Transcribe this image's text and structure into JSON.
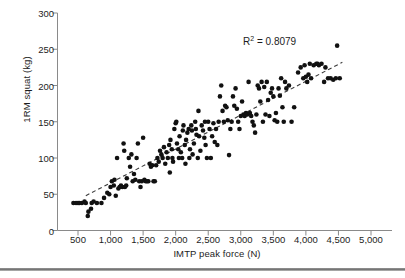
{
  "figure": {
    "name": "scatter-plot-imtp-vs-1rm-squat",
    "annotation": {
      "label_prefix": "R",
      "label_sup": "2",
      "label_suffix": " = 0.8079",
      "full": "R² = 0.8079"
    }
  },
  "chart_data": {
    "type": "scatter",
    "title": "",
    "xlabel": "IMTP peak force (N)",
    "ylabel": "1RM squat (kg)",
    "xlim": [
      0,
      5250
    ],
    "ylim": [
      0,
      300
    ],
    "xticks": [
      500,
      1000,
      1500,
      2000,
      2500,
      3000,
      3500,
      4000,
      4500,
      5000
    ],
    "xtick_labels": [
      "500",
      "1,000",
      "1,500",
      "2,000",
      "2,500",
      "3,000",
      "3,500",
      "4,000",
      "4,500",
      "5,000"
    ],
    "yticks": [
      0,
      50,
      100,
      150,
      200,
      250,
      300
    ],
    "ytick_labels": [
      "0",
      "50",
      "100",
      "150",
      "200",
      "250",
      "300"
    ],
    "grid": false,
    "legend": null,
    "marker": {
      "shape": "circle",
      "color": "#111111",
      "size_px": 4.6
    },
    "annotations": [
      {
        "text": "R² = 0.8079",
        "x": 3650,
        "y": 268
      }
    ],
    "trendline": {
      "style": "dashed",
      "color": "#3a3a3a",
      "x_start": 620,
      "y_start": 48,
      "x_end": 4560,
      "y_end": 232
    },
    "r_squared": 0.8079,
    "n_points": 190,
    "points": [
      [
        430,
        38
      ],
      [
        470,
        38
      ],
      [
        500,
        38
      ],
      [
        520,
        38
      ],
      [
        560,
        38
      ],
      [
        600,
        40
      ],
      [
        620,
        38
      ],
      [
        650,
        20
      ],
      [
        660,
        26
      ],
      [
        700,
        30
      ],
      [
        710,
        38
      ],
      [
        740,
        40
      ],
      [
        790,
        38
      ],
      [
        860,
        38
      ],
      [
        900,
        45
      ],
      [
        950,
        52
      ],
      [
        980,
        50
      ],
      [
        1000,
        60
      ],
      [
        1020,
        68
      ],
      [
        1050,
        62
      ],
      [
        1060,
        70
      ],
      [
        1080,
        48
      ],
      [
        1100,
        100
      ],
      [
        1120,
        58
      ],
      [
        1140,
        60
      ],
      [
        1160,
        62
      ],
      [
        1180,
        60
      ],
      [
        1200,
        120
      ],
      [
        1210,
        110
      ],
      [
        1220,
        60
      ],
      [
        1240,
        62
      ],
      [
        1250,
        72
      ],
      [
        1280,
        100
      ],
      [
        1300,
        88
      ],
      [
        1320,
        105
      ],
      [
        1340,
        68
      ],
      [
        1360,
        78
      ],
      [
        1380,
        70
      ],
      [
        1400,
        100
      ],
      [
        1420,
        120
      ],
      [
        1440,
        68
      ],
      [
        1460,
        60
      ],
      [
        1480,
        68
      ],
      [
        1500,
        128
      ],
      [
        1520,
        70
      ],
      [
        1540,
        68
      ],
      [
        1560,
        68
      ],
      [
        1580,
        68
      ],
      [
        1600,
        92
      ],
      [
        1620,
        88
      ],
      [
        1640,
        90
      ],
      [
        1660,
        68
      ],
      [
        1680,
        68
      ],
      [
        1700,
        90
      ],
      [
        1720,
        100
      ],
      [
        1740,
        95
      ],
      [
        1760,
        110
      ],
      [
        1780,
        105
      ],
      [
        1800,
        100
      ],
      [
        1820,
        115
      ],
      [
        1840,
        92
      ],
      [
        1860,
        108
      ],
      [
        1880,
        100
      ],
      [
        1900,
        118
      ],
      [
        1910,
        80
      ],
      [
        1920,
        125
      ],
      [
        1940,
        112
      ],
      [
        1950,
        100
      ],
      [
        1960,
        95
      ],
      [
        1980,
        140
      ],
      [
        2000,
        148
      ],
      [
        2010,
        150
      ],
      [
        2020,
        120
      ],
      [
        2040,
        112
      ],
      [
        2050,
        100
      ],
      [
        2060,
        130
      ],
      [
        2080,
        108
      ],
      [
        2100,
        100
      ],
      [
        2110,
        138
      ],
      [
        2120,
        145
      ],
      [
        2140,
        118
      ],
      [
        2150,
        92
      ],
      [
        2160,
        125
      ],
      [
        2180,
        135
      ],
      [
        2200,
        140
      ],
      [
        2210,
        100
      ],
      [
        2220,
        112
      ],
      [
        2240,
        145
      ],
      [
        2250,
        138
      ],
      [
        2260,
        105
      ],
      [
        2280,
        120
      ],
      [
        2300,
        150
      ],
      [
        2310,
        140
      ],
      [
        2320,
        132
      ],
      [
        2340,
        100
      ],
      [
        2350,
        165
      ],
      [
        2360,
        130
      ],
      [
        2380,
        110
      ],
      [
        2400,
        145
      ],
      [
        2420,
        138
      ],
      [
        2440,
        128
      ],
      [
        2450,
        150
      ],
      [
        2460,
        118
      ],
      [
        2480,
        100
      ],
      [
        2500,
        150
      ],
      [
        2520,
        140
      ],
      [
        2540,
        100
      ],
      [
        2560,
        130
      ],
      [
        2580,
        148
      ],
      [
        2600,
        122
      ],
      [
        2620,
        140
      ],
      [
        2640,
        118
      ],
      [
        2660,
        150
      ],
      [
        2680,
        185
      ],
      [
        2700,
        200
      ],
      [
        2720,
        165
      ],
      [
        2740,
        150
      ],
      [
        2760,
        172
      ],
      [
        2780,
        170
      ],
      [
        2800,
        152
      ],
      [
        2820,
        104
      ],
      [
        2840,
        140
      ],
      [
        2860,
        150
      ],
      [
        2880,
        185
      ],
      [
        2900,
        172
      ],
      [
        2920,
        196
      ],
      [
        2940,
        168
      ],
      [
        2960,
        150
      ],
      [
        2980,
        140
      ],
      [
        3000,
        158
      ],
      [
        3020,
        178
      ],
      [
        3040,
        160
      ],
      [
        3060,
        158
      ],
      [
        3080,
        162
      ],
      [
        3100,
        160
      ],
      [
        3120,
        205
      ],
      [
        3140,
        162
      ],
      [
        3160,
        158
      ],
      [
        3180,
        150
      ],
      [
        3200,
        145
      ],
      [
        3220,
        135
      ],
      [
        3240,
        160
      ],
      [
        3260,
        200
      ],
      [
        3280,
        196
      ],
      [
        3300,
        178
      ],
      [
        3320,
        205
      ],
      [
        3340,
        150
      ],
      [
        3360,
        198
      ],
      [
        3380,
        160
      ],
      [
        3400,
        205
      ],
      [
        3420,
        180
      ],
      [
        3440,
        158
      ],
      [
        3460,
        190
      ],
      [
        3480,
        196
      ],
      [
        3500,
        185
      ],
      [
        3520,
        152
      ],
      [
        3540,
        162
      ],
      [
        3560,
        150
      ],
      [
        3580,
        196
      ],
      [
        3600,
        186
      ],
      [
        3620,
        210
      ],
      [
        3640,
        170
      ],
      [
        3660,
        150
      ],
      [
        3680,
        205
      ],
      [
        3700,
        196
      ],
      [
        3740,
        200
      ],
      [
        3780,
        150
      ],
      [
        3820,
        170
      ],
      [
        3880,
        218
      ],
      [
        3920,
        225
      ],
      [
        3960,
        210
      ],
      [
        3980,
        228
      ],
      [
        4000,
        212
      ],
      [
        4020,
        205
      ],
      [
        4040,
        215
      ],
      [
        4060,
        230
      ],
      [
        4080,
        210
      ],
      [
        4120,
        228
      ],
      [
        4160,
        230
      ],
      [
        4180,
        230
      ],
      [
        4200,
        228
      ],
      [
        4240,
        230
      ],
      [
        4280,
        205
      ],
      [
        4300,
        225
      ],
      [
        4340,
        210
      ],
      [
        4380,
        210
      ],
      [
        4420,
        208
      ],
      [
        4460,
        210
      ],
      [
        4480,
        255
      ],
      [
        4520,
        210
      ]
    ]
  }
}
